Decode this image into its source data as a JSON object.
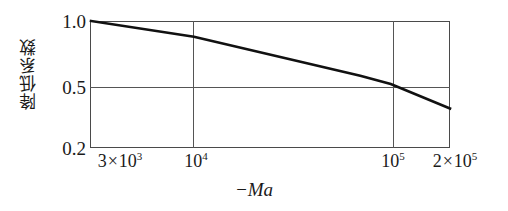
{
  "chart_data": {
    "type": "line",
    "title": "",
    "subtitle": "",
    "xlabel": "−Ma",
    "ylabel": "降低系数",
    "xscale": "log",
    "yscale": "log",
    "xlim": [
      3000,
      200000
    ],
    "ylim": [
      0.2,
      1.0
    ],
    "grid": true,
    "legend": null,
    "xticks": [
      {
        "value": 3000,
        "label": "3×10³",
        "coef": "3",
        "mult": "×",
        "base": "10",
        "exp": "3"
      },
      {
        "value": 10000,
        "label": "10⁴",
        "coef": "",
        "mult": "",
        "base": "10",
        "exp": "4"
      },
      {
        "value": 100000,
        "label": "10⁵",
        "coef": "",
        "mult": "",
        "base": "10",
        "exp": "5"
      },
      {
        "value": 200000,
        "label": "2×10⁵",
        "coef": "2",
        "mult": "×",
        "base": "10",
        "exp": "5"
      }
    ],
    "yticks": [
      {
        "value": 1.0,
        "label": "1.0"
      },
      {
        "value": 0.5,
        "label": "0.5"
      },
      {
        "value": 0.2,
        "label": "0.2"
      }
    ],
    "series": [
      {
        "name": "降低系数",
        "color": "#111111",
        "points": [
          {
            "x": 3000,
            "y": 1.0
          },
          {
            "x": 10000,
            "y": 0.82
          },
          {
            "x": 70000,
            "y": 0.5
          },
          {
            "x": 100000,
            "y": 0.45
          },
          {
            "x": 200000,
            "y": 0.33
          }
        ]
      }
    ]
  },
  "style": {
    "frame_color": "#4a4a4a",
    "grid_color": "#555555",
    "line_color": "#111111",
    "text_color": "#1a1a1a",
    "background": "#ffffff"
  }
}
